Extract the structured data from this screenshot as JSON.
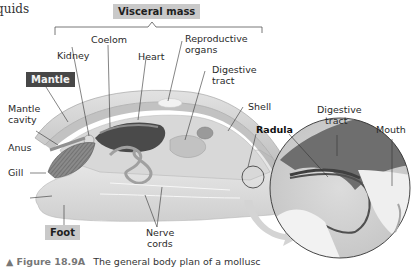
{
  "page_fragment": "quids",
  "labels": {
    "visceral_mass": "Visceral mass",
    "coelom": "Coelom",
    "kidney": "Kidney",
    "heart": "Heart",
    "reproductive_organs_1": "Reproductive",
    "reproductive_organs_2": "organs",
    "digestive_tract_1": "Digestive",
    "digestive_tract_2": "tract",
    "mantle": "Mantle",
    "mantle_cavity_1": "Mantle",
    "mantle_cavity_2": "cavity",
    "shell": "Shell",
    "radula": "Radula",
    "anus": "Anus",
    "gill": "Gill",
    "foot": "Foot",
    "nerve_cords_1": "Nerve",
    "nerve_cords_2": "cords",
    "inset_digestive_tract_1": "Digestive",
    "inset_digestive_tract_2": "tract",
    "mouth": "Mouth"
  },
  "caption": {
    "figure": "▲ Figure 18.9A",
    "text": "The general body plan of a mollusc"
  }
}
